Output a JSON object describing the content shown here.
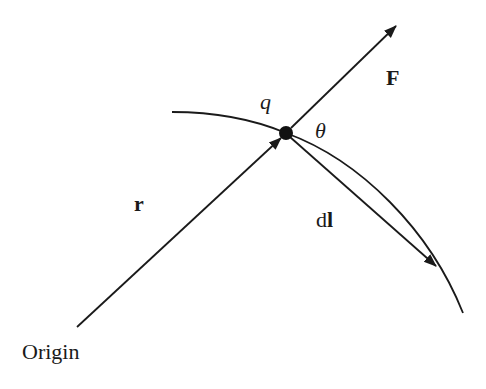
{
  "diagram": {
    "colors": {
      "stroke": "#1a1a1a",
      "background": "#ffffff"
    },
    "labels": {
      "charge": "q",
      "force": "F",
      "angle": "θ",
      "position": "r",
      "displacement_d": "d",
      "displacement_l": "l",
      "origin": "Origin"
    },
    "elements": [
      {
        "id": "charge",
        "type": "point",
        "label": "q",
        "x": 286,
        "y": 133
      },
      {
        "id": "force-vector",
        "type": "arrow",
        "label": "F",
        "from": [
          286,
          133
        ],
        "to": [
          397,
          25
        ]
      },
      {
        "id": "position-vector",
        "type": "arrow",
        "label": "r",
        "from": [
          77,
          327
        ],
        "to": [
          281,
          137
        ]
      },
      {
        "id": "displacement-vector",
        "type": "arrow",
        "label": "dl",
        "from": [
          286,
          133
        ],
        "to": [
          437,
          267
        ]
      },
      {
        "id": "trajectory",
        "type": "curve",
        "from": [
          172,
          112
        ],
        "to": [
          463,
          313
        ]
      },
      {
        "id": "angle",
        "type": "angle-label",
        "label": "θ",
        "between": [
          "force-vector",
          "displacement-vector"
        ]
      }
    ]
  }
}
